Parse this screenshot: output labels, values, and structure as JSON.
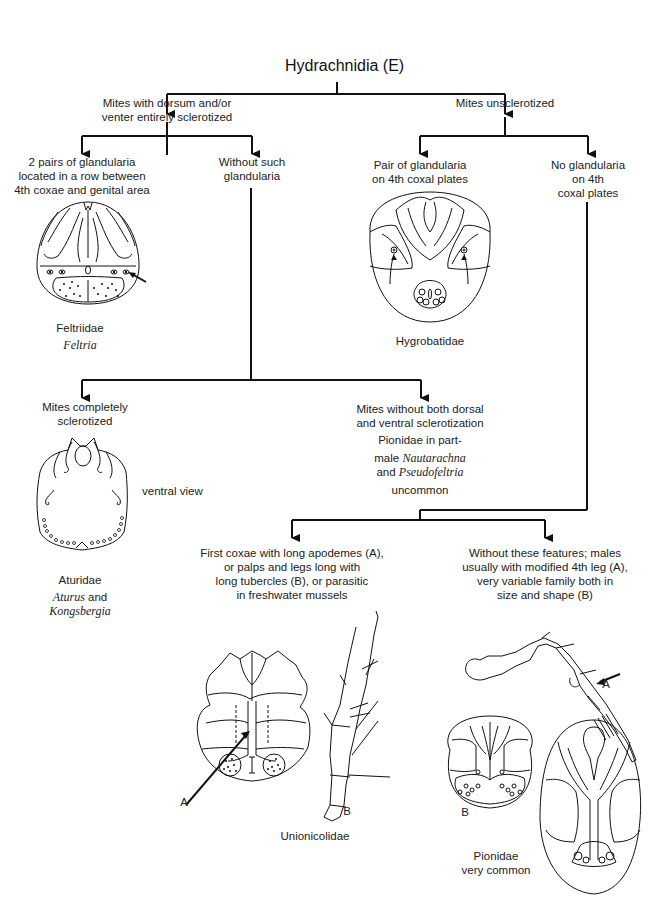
{
  "title": "Hydrachnidia (E)",
  "nodes": {
    "sclerotized": {
      "line1": "Mites with dorsum and/or",
      "line2": "venter entirely sclerotized"
    },
    "unsclerotized": {
      "line1": "Mites unsclerotized"
    },
    "two_pairs": {
      "line1": "2 pairs of glandularia",
      "line2": "located in a row between",
      "line3": "4th coxae and genital area"
    },
    "without_such": {
      "line1": "Without such",
      "line2": "glandularia"
    },
    "pair_glandularia": {
      "line1": "Pair of glandularia",
      "line2": "on 4th coxal plates"
    },
    "no_glandularia": {
      "line1": "No glandularia",
      "line2": "on 4th",
      "line3": "coxal plates"
    },
    "completely": {
      "line1": "Mites completely",
      "line2": "sclerotized"
    },
    "without_both": {
      "line1": "Mites without both dorsal",
      "line2": "and ventral sclerotization"
    },
    "first_coxae": {
      "line1": "First coxae with long apodemes (A),",
      "line2": "or palps and legs long with",
      "line3": "long tubercles (B), or parasitic",
      "line4": "in freshwater mussels"
    },
    "without_features": {
      "line1": "Without these features; males",
      "line2": "usually with modified 4th leg (A),",
      "line3": "very variable family both in",
      "line4": "size and shape (B)"
    }
  },
  "taxa": {
    "feltriidae": {
      "family": "Feltriidae",
      "genus": "Feltria"
    },
    "hygrobatidae": {
      "family": "Hygrobatidae"
    },
    "aturidae": {
      "family": "Aturidae",
      "genus1": "Aturus",
      "and": "and",
      "genus2": "Kongsbergia",
      "view": "ventral view"
    },
    "pionidae_part": {
      "line1": "Pionidae in part-",
      "male": "male",
      "genus1": "Nautarachna",
      "and": "and",
      "genus2": "Pseudofeltria",
      "status": "uncommon"
    },
    "unionicolidae": {
      "family": "Unionicolidae",
      "label_a": "A",
      "label_b": "B"
    },
    "pionidae": {
      "family": "Pionidae",
      "status": "very common",
      "label_a": "A",
      "label_b": "B"
    }
  }
}
